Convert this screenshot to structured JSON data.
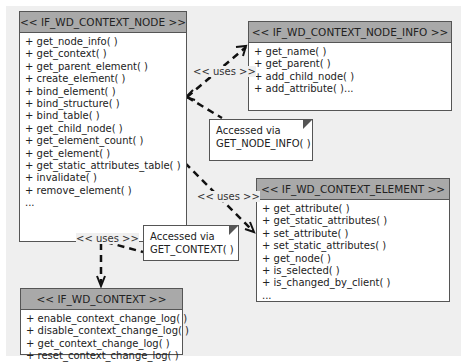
{
  "diagram": {
    "boxes": {
      "context_node": {
        "title": "<< IF_WD_CONTEXT_NODE >>",
        "methods": [
          "+ get_node_info( )",
          "+ get_context( )",
          "+ get_parent_element( )",
          "+ create_element( )",
          "+ bind_element( )",
          "+ bind_structure( )",
          "+ bind_table( )",
          "+ get_child_node( )",
          "+ get_element_count( )",
          "+ get_element( )",
          "+ get_static_attributes_table( )",
          "+ invalidate( )",
          "+ remove_element( )",
          "..."
        ]
      },
      "context_node_info": {
        "title": "<< IF_WD_CONTEXT_NODE_INFO >>",
        "methods": [
          "+ get_name( )",
          "+ get_parent( )",
          "+ add_child_node( )",
          "+ add_attribute( )..."
        ]
      },
      "context_element": {
        "title": "<< IF_WD_CONTEXT_ELEMENT >>",
        "methods": [
          "+ get_attribute( )",
          "+ get_static_attributes( )",
          "+ set_attribute( )",
          "+ set_static_attributes( )",
          "+ get_node( )",
          "+ is_selected( )",
          "+ is_changed_by_client( )",
          "..."
        ]
      },
      "context": {
        "title": "<< IF_WD_CONTEXT >>",
        "methods": [
          "+ enable_context_change_log( )",
          "+ disable_context_change_log( )",
          "+ get_context_change_log( )",
          "+ reset_context_change_log( )"
        ]
      }
    },
    "notes": {
      "node_info": {
        "line1": "Accessed via",
        "line2": "GET_NODE_INFO( )"
      },
      "context": {
        "line1": "Accessed via",
        "line2": "GET_CONTEXT( )"
      }
    },
    "relations": {
      "uses_node_info": "<< uses  >>",
      "uses_element": "<< uses  >>",
      "uses_context": "<< uses  >>"
    },
    "colors": {
      "header": "#a9a9a9",
      "background": "#efefef",
      "border": "#555555"
    }
  }
}
